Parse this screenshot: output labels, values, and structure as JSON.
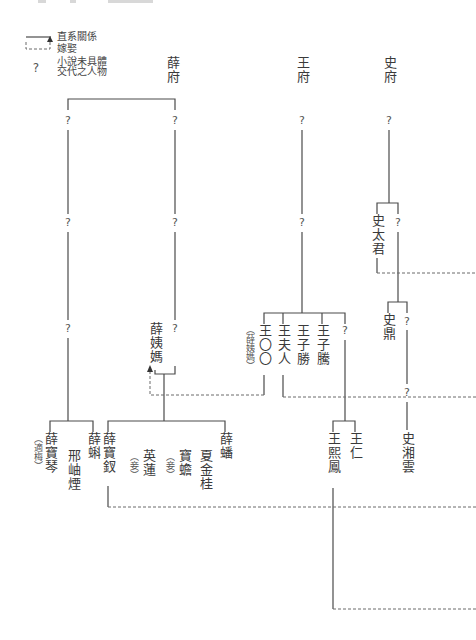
{
  "header": {
    "note": "cropped header text (illegible)"
  },
  "legend": {
    "solid_label": "直系關係",
    "dashed_label": "嫁娶",
    "unknown_symbol": "?",
    "unknown_label_line1": "小說未具體",
    "unknown_label_line2": "交代之人物"
  },
  "families": {
    "xue": "薛府",
    "wang": "王府",
    "shi": "史府"
  },
  "unknown": "?",
  "people": {
    "shi_taijun": "史太君",
    "xue_yima": "薛姨媽",
    "wang_oo": "王〇〇",
    "wang_oo_note": "（薛姨媽）",
    "wang_furen": "王夫人",
    "wang_zisheng": "王子勝",
    "wang_ziteng": "王子騰",
    "shi_ding": "史鼎",
    "xue_baoqin": "薛寶琴",
    "xue_baoqin_note": "（適梅）",
    "xing_xiuyan": "邢岫煙",
    "xue_ke": "薛蝌",
    "xue_baochai": "薛寶釵",
    "ying_lian": "英蓮",
    "ying_lian_note": "（妾）",
    "bao_chan": "寶蟾",
    "bao_chan_note": "（妾）",
    "xia_jingui": "夏金桂",
    "xue_pan": "薛蟠",
    "wang_xifeng": "王熙鳳",
    "wang_ren": "王仁",
    "shi_xiangyun": "史湘雲"
  },
  "colors": {
    "line": "#4a4a4a",
    "dashed": "#6a6a6a",
    "text": "#3a3a3a"
  }
}
